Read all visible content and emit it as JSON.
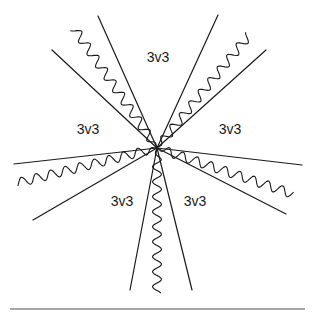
{
  "diagram": {
    "vertex": {
      "x": 157,
      "y": 148
    },
    "labels": [
      {
        "text": "3v3",
        "x": 158,
        "y": 58
      },
      {
        "text": "3v3",
        "x": 88,
        "y": 130
      },
      {
        "text": "3v3",
        "x": 230,
        "y": 130
      },
      {
        "text": "3v3",
        "x": 122,
        "y": 202
      },
      {
        "text": "3v3",
        "x": 195,
        "y": 202
      }
    ],
    "legs": [
      {
        "lines": [
          [
            52,
            50
          ],
          [
            98,
            16
          ]
        ],
        "wave_end": [
          74,
          28
        ]
      },
      {
        "lines": [
          [
            218,
            15
          ],
          [
            266,
            50
          ]
        ],
        "wave_end": [
          249,
          35
        ]
      },
      {
        "lines": [
          [
            14,
            164
          ],
          [
            33,
            220
          ]
        ],
        "wave_end": [
          17,
          183
        ]
      },
      {
        "lines": [
          [
            302,
            165
          ],
          [
            286,
            214
          ]
        ],
        "wave_end": [
          293,
          194
        ]
      },
      {
        "lines": [
          [
            130,
            290
          ],
          [
            192,
            290
          ]
        ],
        "wave_end": [
          157,
          293
        ]
      }
    ],
    "rule": {
      "x1": 10,
      "x2": 305,
      "y": 309
    }
  }
}
